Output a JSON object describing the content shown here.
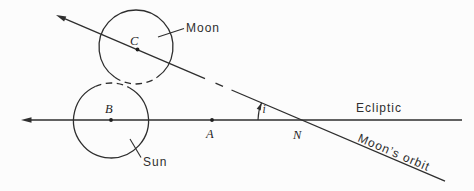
{
  "figure": {
    "labels": {
      "moon": "Moon",
      "sun": "Sun",
      "ecliptic": "Ecliptic",
      "moons_orbit": "Moon’s orbit"
    },
    "points": {
      "c": "C",
      "b": "B",
      "a": "A",
      "n": "N"
    },
    "angle_symbol": "i",
    "colors": {
      "ink": "#2e2e2e",
      "background": "#fcfcfc"
    }
  }
}
